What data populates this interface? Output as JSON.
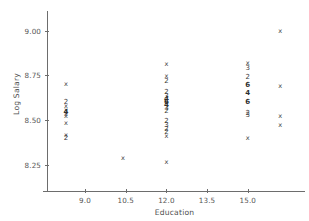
{
  "chart_data": {
    "type": "scatter",
    "title": "",
    "xlabel": "Education",
    "ylabel": "Log Salary",
    "xlim": [
      7.6,
      17.0
    ],
    "ylim": [
      8.13,
      9.07
    ],
    "xticks": [
      "9.0",
      "10.5",
      "12.0",
      "13.5",
      "15.0"
    ],
    "xtick_values": [
      9.0,
      10.5,
      12.0,
      13.5,
      15.0
    ],
    "yticks": [
      "8.25",
      "8.50",
      "8.75",
      "9.00"
    ],
    "ytick_values": [
      8.25,
      8.5,
      8.75,
      9.0
    ],
    "grid": false,
    "legend": null,
    "marker_glyph": "x",
    "note": "Overplotted observations are drawn as a digit giving the number of coincident points at that location; single points are drawn as an x glyph.",
    "points": [
      {
        "x": 8.3,
        "y": 8.7,
        "label": "x",
        "count": 1
      },
      {
        "x": 8.3,
        "y": 8.6,
        "label": "2",
        "count": 2
      },
      {
        "x": 8.3,
        "y": 8.575,
        "label": "x",
        "count": 1
      },
      {
        "x": 8.3,
        "y": 8.558,
        "label": "x",
        "count": 1
      },
      {
        "x": 8.3,
        "y": 8.545,
        "label": "4",
        "count": 4
      },
      {
        "x": 8.3,
        "y": 8.532,
        "label": "x",
        "count": 1
      },
      {
        "x": 8.3,
        "y": 8.52,
        "label": "x",
        "count": 1
      },
      {
        "x": 8.3,
        "y": 8.485,
        "label": "x",
        "count": 1
      },
      {
        "x": 8.3,
        "y": 8.415,
        "label": "x",
        "count": 1
      },
      {
        "x": 8.3,
        "y": 8.398,
        "label": "2",
        "count": 2
      },
      {
        "x": 10.4,
        "y": 8.285,
        "label": "x",
        "count": 1
      },
      {
        "x": 12.0,
        "y": 8.815,
        "label": "x",
        "count": 1
      },
      {
        "x": 12.0,
        "y": 8.745,
        "label": "x",
        "count": 1
      },
      {
        "x": 12.0,
        "y": 8.715,
        "label": "2",
        "count": 2
      },
      {
        "x": 12.0,
        "y": 8.655,
        "label": "2",
        "count": 2
      },
      {
        "x": 12.0,
        "y": 8.635,
        "label": "3",
        "count": 3
      },
      {
        "x": 12.0,
        "y": 8.618,
        "label": "4",
        "count": 4
      },
      {
        "x": 12.0,
        "y": 8.6,
        "label": "6",
        "count": 6
      },
      {
        "x": 12.0,
        "y": 8.583,
        "label": "4",
        "count": 4
      },
      {
        "x": 12.0,
        "y": 8.566,
        "label": "3",
        "count": 3
      },
      {
        "x": 12.0,
        "y": 8.549,
        "label": "2",
        "count": 2
      },
      {
        "x": 12.0,
        "y": 8.495,
        "label": "2",
        "count": 2
      },
      {
        "x": 12.0,
        "y": 8.47,
        "label": "3",
        "count": 3
      },
      {
        "x": 12.0,
        "y": 8.45,
        "label": "2",
        "count": 2
      },
      {
        "x": 12.0,
        "y": 8.432,
        "label": "2",
        "count": 2
      },
      {
        "x": 12.0,
        "y": 8.412,
        "label": "x",
        "count": 1
      },
      {
        "x": 12.0,
        "y": 8.262,
        "label": "x",
        "count": 1
      },
      {
        "x": 15.0,
        "y": 8.818,
        "label": "x",
        "count": 1
      },
      {
        "x": 15.0,
        "y": 8.788,
        "label": "3",
        "count": 3
      },
      {
        "x": 15.0,
        "y": 8.742,
        "label": "2",
        "count": 2
      },
      {
        "x": 15.0,
        "y": 8.695,
        "label": "6",
        "count": 6
      },
      {
        "x": 15.0,
        "y": 8.648,
        "label": "4",
        "count": 4
      },
      {
        "x": 15.0,
        "y": 8.6,
        "label": "6",
        "count": 6
      },
      {
        "x": 15.0,
        "y": 8.54,
        "label": "2",
        "count": 2
      },
      {
        "x": 15.0,
        "y": 8.525,
        "label": "3",
        "count": 3
      },
      {
        "x": 15.0,
        "y": 8.398,
        "label": "x",
        "count": 1
      },
      {
        "x": 16.2,
        "y": 8.995,
        "label": "x",
        "count": 1
      },
      {
        "x": 16.2,
        "y": 8.692,
        "label": "x",
        "count": 1
      },
      {
        "x": 16.2,
        "y": 8.52,
        "label": "x",
        "count": 1
      },
      {
        "x": 16.2,
        "y": 8.472,
        "label": "x",
        "count": 1
      }
    ]
  },
  "axes": {
    "x_title": "Education",
    "y_title": "Log Salary"
  }
}
